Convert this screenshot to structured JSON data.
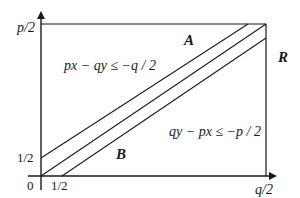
{
  "diagram": {
    "axes": {
      "y_top_label": "p/2",
      "x_right_label": "q/2",
      "origin_label": "0",
      "y_half_label": "1/2",
      "x_half_label": "1/2"
    },
    "regions": {
      "A": "A",
      "B": "B",
      "R": "R"
    },
    "inequalities": {
      "upper": "px − qy ≤ −q / 2",
      "lower": "qy − px ≤ −p / 2"
    },
    "colors": {
      "stroke": "#1a1a1a",
      "background": "#ffffff"
    }
  }
}
